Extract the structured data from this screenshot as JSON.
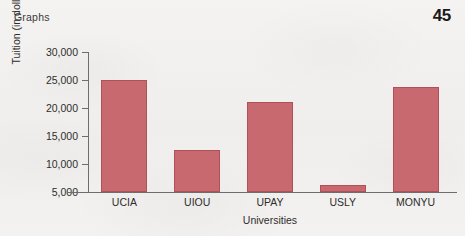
{
  "header": {
    "running_head": "Graphs",
    "page_number": "45"
  },
  "chart_data": {
    "type": "bar",
    "title": "",
    "categories": [
      "UCIA",
      "UIOU",
      "UPAY",
      "USLY",
      "MONYU"
    ],
    "values": [
      25000,
      12500,
      21000,
      6200,
      23800
    ],
    "xlabel": "Universities",
    "ylabel": "Tuition (in dollars)",
    "ylim": [
      5000,
      30000
    ],
    "ytick_labels": [
      "30,000",
      "25,000",
      "20,000",
      "15,000",
      "10,000",
      "5,000"
    ],
    "ytick_values": [
      30000,
      25000,
      20000,
      15000,
      10000,
      5000
    ],
    "grid": false,
    "legend": "none",
    "bar_color": "#c8686f",
    "bar_edge_color": "#b05159",
    "axis_color": "#6f6d6b",
    "background_color": "#f2f1ef"
  }
}
